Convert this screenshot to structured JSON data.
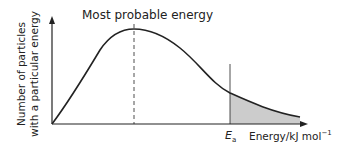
{
  "diagram": {
    "title": "Most probable energy",
    "y_axis_label_line1": "Number of particles",
    "y_axis_label_line2": "with a particular energy",
    "activation_energy_symbol": "E",
    "activation_energy_subscript": "a",
    "x_axis_label": "Energy/kJ mol",
    "x_axis_label_superscript": "−1",
    "colors": {
      "line": "#222222",
      "shaded_area": "#cccccc"
    }
  }
}
